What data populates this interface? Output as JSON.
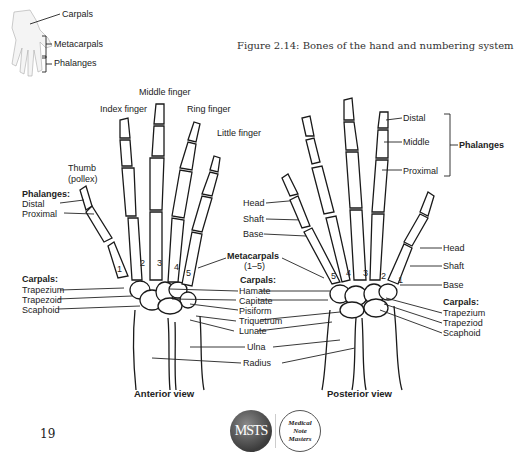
{
  "caption": "Figure 2.14: Bones of the hand and numbering system",
  "thumbnail": {
    "labels": {
      "carpals": "Carpals",
      "metacarpals": "Metacarpals",
      "phalanges": "Phalanges"
    }
  },
  "anterior": {
    "view_label": "Anterior view",
    "fingers": {
      "middle": "Middle finger",
      "index": "Index finger",
      "ring": "Ring finger",
      "little": "Little finger",
      "thumb_line1": "Thumb",
      "thumb_line2": "(pollex)"
    },
    "phalanges": {
      "title": "Phalanges:",
      "distal": "Distal",
      "proximal": "Proximal"
    },
    "carpals_left": {
      "title": "Carpals:",
      "items": [
        "Trapezium",
        "Trapezoid",
        "Scaphoid"
      ]
    },
    "metacarpal_numbers": [
      "1",
      "2",
      "3",
      "4",
      "5"
    ]
  },
  "center": {
    "metacarpals_line1": "Metacarpals",
    "metacarpals_line2": "(1–5)",
    "carpals_title": "Carpals:",
    "carpals": [
      "Hamate",
      "Capitate",
      "Pisiform",
      "Triquetrum",
      "Lunate"
    ],
    "ulna": "Ulna",
    "radius": "Radius",
    "metacarpal_parts": [
      "Head",
      "Shaft",
      "Base"
    ]
  },
  "posterior": {
    "view_label": "Posterior view",
    "phalanx_parts": [
      "Distal",
      "Middle",
      "Proximal"
    ],
    "phalanges_group": "Phalanges",
    "metacarpal_parts": [
      "Head",
      "Shaft",
      "Base"
    ],
    "carpals": {
      "title": "Carpals:",
      "items": [
        "Trapezium",
        "Trapeziod",
        "Scaphoid"
      ]
    },
    "metacarpal_numbers": [
      "5",
      "4",
      "3",
      "2",
      "1"
    ]
  },
  "footer": {
    "page_number": "19",
    "logo_left": "MSTS",
    "logo_right": [
      "Medical",
      "Note",
      "Masters"
    ]
  }
}
